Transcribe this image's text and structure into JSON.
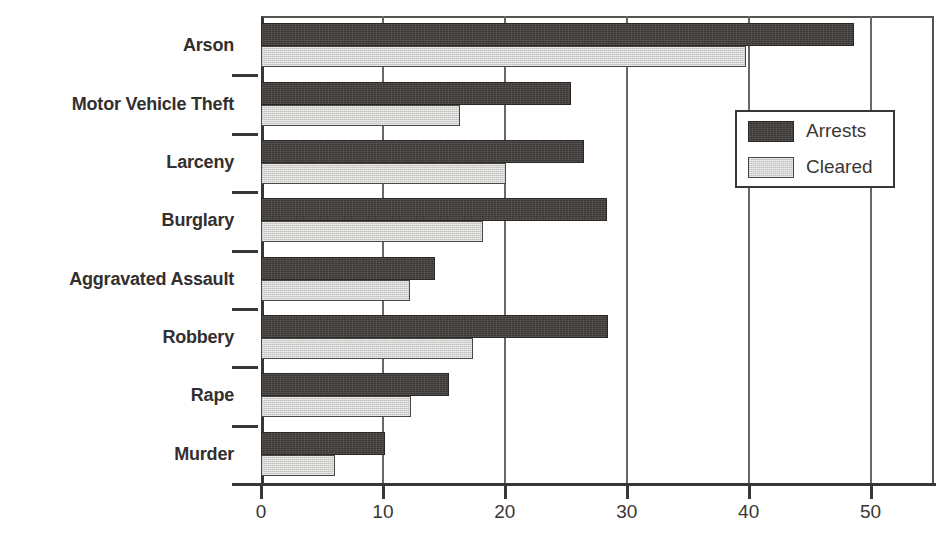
{
  "chart_data": {
    "type": "bar",
    "orientation": "horizontal",
    "title": "",
    "xlabel": "",
    "ylabel": "",
    "xlim": [
      0,
      55.2
    ],
    "ylim": [
      0,
      8
    ],
    "grid": true,
    "grid_axis": "x",
    "legend_position": "upper right",
    "xticks": [
      0,
      10,
      20,
      30,
      40,
      50
    ],
    "xtick_labels": [
      "0",
      "10",
      "20",
      "30",
      "40",
      "50"
    ],
    "categories": [
      "Murder",
      "Rape",
      "Robbery",
      "Aggravated Assault",
      "Burglary",
      "Larceny",
      "Motor Vehicle Theft",
      "Arson"
    ],
    "series": [
      {
        "name": "Arrests",
        "color": "#3a3634",
        "values": [
          10.2,
          15.4,
          28.5,
          14.3,
          28.4,
          26.5,
          25.4,
          48.6
        ]
      },
      {
        "name": "Cleared",
        "color": "#d2d2d0",
        "values": [
          6.1,
          12.3,
          17.4,
          12.2,
          18.2,
          20.1,
          16.3,
          39.8
        ]
      }
    ]
  },
  "legend": {
    "entries": [
      {
        "label": "Arrests",
        "swatch": "arrests"
      },
      {
        "label": "Cleared",
        "swatch": "cleared"
      }
    ]
  }
}
